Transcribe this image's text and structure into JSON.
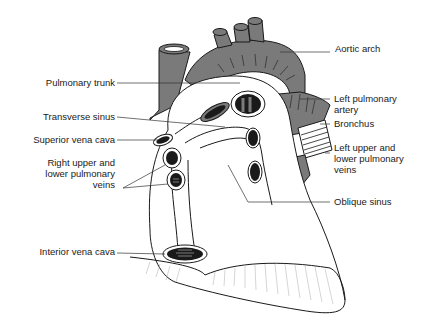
{
  "figure": {
    "colors": {
      "vessel_fill": "#7a7a7a",
      "heart_fill": "#ffffff",
      "outline": "#1a1a1a",
      "lumen": "#1a1a1a",
      "leader": "#333333"
    }
  },
  "labels": {
    "left": [
      {
        "id": "pulmonary_trunk",
        "text": "Pulmonary trunk"
      },
      {
        "id": "transverse_sinus",
        "text": "Transverse sinus"
      },
      {
        "id": "superior_vena_cava",
        "text": "Superior vena cava"
      },
      {
        "id": "right_pulmonary_veins_1",
        "text": "Right upper and"
      },
      {
        "id": "right_pulmonary_veins_2",
        "text": "lower pulmonary"
      },
      {
        "id": "right_pulmonary_veins_3",
        "text": "veins"
      },
      {
        "id": "interior_vena_cava",
        "text": "Interior vena cava"
      }
    ],
    "right": [
      {
        "id": "aortic_arch",
        "text": "Aortic arch"
      },
      {
        "id": "left_pulmonary_artery_1",
        "text": "Left pulmonary"
      },
      {
        "id": "left_pulmonary_artery_2",
        "text": "artery"
      },
      {
        "id": "bronchus",
        "text": "Bronchus"
      },
      {
        "id": "left_pulmonary_veins_1",
        "text": "Left upper and"
      },
      {
        "id": "left_pulmonary_veins_2",
        "text": "lower pulmonary"
      },
      {
        "id": "left_pulmonary_veins_3",
        "text": "veins"
      },
      {
        "id": "oblique_sinus",
        "text": "Oblique sinus"
      }
    ]
  }
}
